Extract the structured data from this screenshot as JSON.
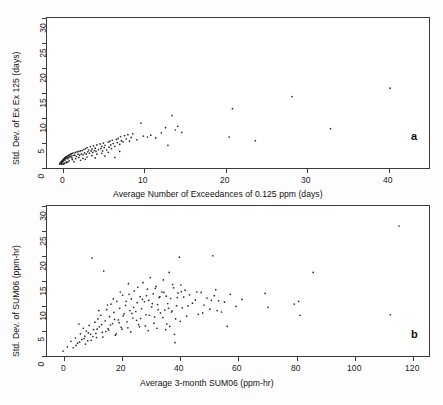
{
  "figure": {
    "background": "#fdfdfd",
    "axis_color": "#3b3b3b",
    "point_color": "#2b2b2b"
  },
  "panel_a": {
    "letter": "a",
    "xlabel": "Average Number of Exceedances of 0.125 ppm (days)",
    "ylabel": "Std. Dev. of Ex Ex 125 (days)",
    "x_ticks": [
      "0",
      "10",
      "20",
      "30",
      "40"
    ],
    "y_ticks": [
      "0",
      "5",
      "10",
      "15",
      "20",
      "25",
      "30"
    ]
  },
  "panel_b": {
    "letter": "b",
    "xlabel": "Average 3-month SUM06 (ppm-hr)",
    "ylabel": "Std. Dev. of SUM06 (ppm-hr)",
    "x_ticks": [
      "0",
      "20",
      "40",
      "60",
      "80",
      "100",
      "120"
    ],
    "y_ticks": [
      "0",
      "5",
      "10",
      "15",
      "20",
      "25",
      "30"
    ]
  },
  "chart_data": [
    {
      "type": "scatter",
      "panel": "a",
      "title": "",
      "xlabel": "Average Number of Exceedances of 0.125 ppm (days)",
      "ylabel": "Std. Dev. of Ex Ex 125 (days)",
      "xlim": [
        -1.5,
        45.5
      ],
      "ylim": [
        -1.2,
        31.5
      ],
      "xticks": [
        0,
        10,
        20,
        30,
        40
      ],
      "yticks": [
        0,
        5,
        10,
        15,
        20,
        25,
        30
      ],
      "grid": false,
      "legend": null,
      "marker": "dot",
      "points": [
        [
          0.05,
          0.1
        ],
        [
          0.08,
          0.2
        ],
        [
          0.1,
          0.15
        ],
        [
          0.12,
          0.3
        ],
        [
          0.15,
          0.25
        ],
        [
          0.18,
          0.4
        ],
        [
          0.2,
          0.2
        ],
        [
          0.22,
          0.5
        ],
        [
          0.25,
          0.35
        ],
        [
          0.28,
          0.6
        ],
        [
          0.3,
          0.45
        ],
        [
          0.32,
          0.7
        ],
        [
          0.35,
          0.5
        ],
        [
          0.38,
          0.8
        ],
        [
          0.4,
          0.6
        ],
        [
          0.42,
          0.9
        ],
        [
          0.45,
          0.7
        ],
        [
          0.48,
          1.0
        ],
        [
          0.5,
          0.8
        ],
        [
          0.52,
          1.1
        ],
        [
          0.55,
          0.9
        ],
        [
          0.58,
          1.2
        ],
        [
          0.6,
          1.0
        ],
        [
          0.62,
          1.3
        ],
        [
          0.65,
          1.1
        ],
        [
          0.68,
          1.4
        ],
        [
          0.7,
          1.2
        ],
        [
          0.72,
          0.95
        ],
        [
          0.75,
          1.5
        ],
        [
          0.78,
          1.25
        ],
        [
          0.8,
          1.6
        ],
        [
          0.85,
          1.35
        ],
        [
          0.9,
          1.7
        ],
        [
          0.95,
          1.45
        ],
        [
          1.0,
          1.8
        ],
        [
          1.05,
          1.2
        ],
        [
          1.1,
          1.9
        ],
        [
          1.15,
          1.5
        ],
        [
          1.2,
          2.0
        ],
        [
          1.25,
          1.6
        ],
        [
          1.3,
          2.1
        ],
        [
          1.35,
          1.7
        ],
        [
          1.4,
          2.2
        ],
        [
          1.45,
          1.8
        ],
        [
          1.5,
          2.3
        ],
        [
          1.55,
          1.4
        ],
        [
          1.6,
          2.4
        ],
        [
          1.7,
          1.9
        ],
        [
          1.8,
          2.5
        ],
        [
          1.9,
          2.0
        ],
        [
          2.0,
          2.6
        ],
        [
          2.1,
          1.7
        ],
        [
          2.2,
          2.7
        ],
        [
          2.3,
          2.2
        ],
        [
          2.4,
          2.8
        ],
        [
          2.5,
          2.0
        ],
        [
          2.6,
          2.9
        ],
        [
          2.7,
          2.3
        ],
        [
          2.8,
          3.0
        ],
        [
          2.9,
          2.1
        ],
        [
          3.0,
          3.2
        ],
        [
          3.1,
          2.5
        ],
        [
          3.2,
          3.4
        ],
        [
          3.3,
          2.2
        ],
        [
          3.4,
          3.6
        ],
        [
          3.5,
          2.7
        ],
        [
          3.6,
          3.1
        ],
        [
          3.7,
          2.4
        ],
        [
          3.8,
          3.8
        ],
        [
          3.9,
          2.9
        ],
        [
          4.0,
          3.3
        ],
        [
          4.1,
          2.6
        ],
        [
          4.2,
          4.0
        ],
        [
          4.3,
          3.0
        ],
        [
          4.4,
          3.5
        ],
        [
          4.5,
          2.8
        ],
        [
          4.6,
          4.2
        ],
        [
          4.8,
          3.2
        ],
        [
          5.0,
          4.4
        ],
        [
          5.1,
          3.4
        ],
        [
          5.2,
          3.9
        ],
        [
          5.3,
          2.9
        ],
        [
          5.4,
          4.6
        ],
        [
          5.5,
          3.6
        ],
        [
          5.6,
          4.1
        ],
        [
          5.8,
          3.1
        ],
        [
          6.0,
          4.8
        ],
        [
          6.1,
          3.7
        ],
        [
          6.2,
          5.0
        ],
        [
          6.3,
          4.2
        ],
        [
          6.4,
          3.4
        ],
        [
          6.5,
          5.2
        ],
        [
          6.6,
          4.5
        ],
        [
          6.8,
          3.9
        ],
        [
          7.0,
          5.4
        ],
        [
          7.1,
          4.7
        ],
        [
          7.2,
          5.6
        ],
        [
          7.4,
          4.3
        ],
        [
          7.5,
          6.0
        ],
        [
          7.6,
          5.1
        ],
        [
          7.8,
          4.9
        ],
        [
          8.0,
          6.2
        ],
        [
          8.2,
          5.5
        ],
        [
          8.4,
          6.4
        ],
        [
          8.6,
          5.0
        ],
        [
          8.8,
          5.8
        ],
        [
          9.0,
          6.6
        ],
        [
          9.5,
          5.3
        ],
        [
          10.0,
          8.9
        ],
        [
          10.3,
          6.1
        ],
        [
          10.8,
          5.9
        ],
        [
          11.2,
          6.3
        ],
        [
          11.8,
          5.7
        ],
        [
          12.5,
          6.8
        ],
        [
          13.0,
          7.9
        ],
        [
          13.3,
          4.1
        ],
        [
          13.8,
          10.5
        ],
        [
          14.2,
          7.4
        ],
        [
          14.5,
          8.2
        ],
        [
          15.0,
          6.9
        ],
        [
          20.8,
          5.9
        ],
        [
          21.2,
          12.0
        ],
        [
          24.0,
          5.1
        ],
        [
          28.5,
          14.6
        ],
        [
          33.2,
          7.7
        ],
        [
          40.5,
          16.4
        ],
        [
          0.3,
          0.05
        ],
        [
          0.6,
          0.3
        ],
        [
          0.9,
          0.55
        ],
        [
          1.2,
          0.75
        ],
        [
          1.6,
          1.05
        ],
        [
          2.0,
          1.25
        ],
        [
          2.4,
          1.5
        ],
        [
          2.9,
          1.3
        ],
        [
          3.4,
          1.6
        ],
        [
          4.0,
          1.9
        ],
        [
          4.6,
          2.2
        ],
        [
          5.2,
          2.4
        ],
        [
          6.0,
          2.6
        ],
        [
          6.8,
          1.5
        ],
        [
          7.4,
          2.8
        ],
        [
          1.8,
          0.6
        ],
        [
          2.6,
          0.9
        ],
        [
          3.2,
          1.1
        ],
        [
          4.4,
          1.4
        ],
        [
          5.6,
          1.8
        ],
        [
          0.45,
          0.05
        ],
        [
          0.55,
          0.12
        ],
        [
          0.65,
          0.22
        ],
        [
          0.85,
          0.38
        ],
        [
          1.05,
          0.5
        ]
      ]
    },
    {
      "type": "scatter",
      "panel": "b",
      "title": "",
      "xlabel": "Average 3-month SUM06 (ppm-hr)",
      "ylabel": "Std. Dev. of SUM06 (ppm-hr)",
      "xlim": [
        -5,
        127
      ],
      "ylim": [
        -1.2,
        31.5
      ],
      "xticks": [
        0,
        20,
        40,
        60,
        80,
        100,
        120
      ],
      "yticks": [
        0,
        5,
        10,
        15,
        20,
        25,
        30
      ],
      "grid": false,
      "legend": null,
      "marker": "dot",
      "points": [
        [
          0.5,
          0.3
        ],
        [
          2.0,
          1.2
        ],
        [
          3.2,
          2.4
        ],
        [
          4.0,
          1.0
        ],
        [
          4.8,
          3.1
        ],
        [
          5.5,
          2.0
        ],
        [
          6.0,
          6.1
        ],
        [
          6.5,
          4.0
        ],
        [
          7.0,
          2.8
        ],
        [
          7.5,
          5.2
        ],
        [
          8.0,
          3.5
        ],
        [
          8.5,
          4.6
        ],
        [
          9.0,
          2.5
        ],
        [
          9.5,
          5.8
        ],
        [
          10.0,
          3.9
        ],
        [
          10.5,
          20.3
        ],
        [
          11.0,
          4.9
        ],
        [
          11.5,
          6.5
        ],
        [
          12.0,
          3.2
        ],
        [
          12.5,
          7.2
        ],
        [
          13.0,
          5.5
        ],
        [
          13.5,
          8.0
        ],
        [
          14.0,
          4.3
        ],
        [
          14.5,
          17.5
        ],
        [
          15.0,
          6.8
        ],
        [
          15.5,
          9.2
        ],
        [
          16.0,
          5.1
        ],
        [
          16.5,
          7.7
        ],
        [
          17.0,
          10.4
        ],
        [
          17.5,
          6.2
        ],
        [
          18.0,
          8.6
        ],
        [
          18.5,
          3.7
        ],
        [
          19.0,
          11.0
        ],
        [
          19.5,
          7.0
        ],
        [
          20.0,
          9.5
        ],
        [
          20.5,
          5.4
        ],
        [
          21.0,
          12.3
        ],
        [
          21.5,
          8.3
        ],
        [
          22.0,
          10.1
        ],
        [
          22.5,
          6.6
        ],
        [
          23.0,
          14.8
        ],
        [
          23.5,
          9.0
        ],
        [
          24.0,
          11.5
        ],
        [
          24.5,
          7.4
        ],
        [
          25.0,
          13.2
        ],
        [
          25.5,
          8.8
        ],
        [
          26.0,
          10.7
        ],
        [
          26.5,
          6.0
        ],
        [
          27.0,
          12.0
        ],
        [
          27.5,
          9.4
        ],
        [
          28.0,
          15.0
        ],
        [
          28.5,
          10.9
        ],
        [
          29.0,
          8.1
        ],
        [
          29.5,
          13.6
        ],
        [
          30.0,
          11.2
        ],
        [
          30.5,
          16.1
        ],
        [
          31.0,
          9.8
        ],
        [
          31.5,
          12.6
        ],
        [
          32.0,
          7.6
        ],
        [
          32.5,
          14.2
        ],
        [
          33.0,
          10.3
        ],
        [
          33.5,
          11.8
        ],
        [
          34.0,
          8.5
        ],
        [
          34.5,
          13.0
        ],
        [
          35.0,
          15.6
        ],
        [
          35.5,
          9.1
        ],
        [
          36.0,
          12.1
        ],
        [
          36.5,
          10.5
        ],
        [
          37.0,
          17.2
        ],
        [
          37.5,
          11.6
        ],
        [
          38.0,
          8.9
        ],
        [
          38.5,
          13.9
        ],
        [
          39.0,
          2.1
        ],
        [
          39.5,
          10.0
        ],
        [
          40.0,
          12.8
        ],
        [
          40.5,
          20.5
        ],
        [
          41.0,
          14.5
        ],
        [
          41.5,
          9.6
        ],
        [
          42.0,
          11.9
        ],
        [
          42.5,
          13.4
        ],
        [
          43.0,
          7.8
        ],
        [
          44.0,
          12.4
        ],
        [
          45.0,
          10.6
        ],
        [
          46.0,
          11.3
        ],
        [
          47.0,
          8.2
        ],
        [
          48.0,
          12.9
        ],
        [
          49.0,
          10.2
        ],
        [
          50.0,
          11.7
        ],
        [
          51.0,
          9.3
        ],
        [
          52.0,
          20.8
        ],
        [
          52.5,
          12.2
        ],
        [
          53.0,
          13.5
        ],
        [
          54.0,
          11.1
        ],
        [
          55.0,
          8.7
        ],
        [
          56.0,
          10.8
        ],
        [
          57.0,
          5.6
        ],
        [
          58.0,
          12.5
        ],
        [
          60.0,
          9.9
        ],
        [
          62.0,
          11.4
        ],
        [
          70.0,
          12.7
        ],
        [
          71.0,
          9.7
        ],
        [
          80.0,
          10.4
        ],
        [
          81.5,
          11.0
        ],
        [
          82.0,
          8.0
        ],
        [
          86.5,
          17.2
        ],
        [
          113.0,
          8.1
        ],
        [
          116.0,
          27.2
        ],
        [
          5.0,
          1.5
        ],
        [
          6.2,
          2.2
        ],
        [
          7.8,
          3.0
        ],
        [
          9.2,
          4.2
        ],
        [
          10.8,
          3.4
        ],
        [
          12.2,
          5.0
        ],
        [
          13.8,
          6.0
        ],
        [
          15.2,
          4.5
        ],
        [
          16.8,
          5.9
        ],
        [
          18.2,
          7.1
        ],
        [
          19.8,
          6.4
        ],
        [
          21.2,
          7.9
        ],
        [
          22.8,
          5.3
        ],
        [
          24.2,
          8.4
        ],
        [
          25.8,
          6.9
        ],
        [
          27.2,
          7.3
        ],
        [
          28.8,
          5.7
        ],
        [
          30.2,
          8.0
        ],
        [
          31.8,
          6.3
        ],
        [
          33.2,
          9.2
        ],
        [
          34.8,
          7.5
        ],
        [
          36.2,
          6.1
        ],
        [
          37.8,
          8.7
        ],
        [
          39.2,
          7.2
        ],
        [
          40.8,
          6.7
        ],
        [
          20.2,
          13.0
        ],
        [
          23.2,
          12.5
        ],
        [
          26.2,
          14.0
        ],
        [
          29.2,
          12.2
        ],
        [
          32.2,
          13.8
        ],
        [
          35.2,
          12.9
        ],
        [
          38.2,
          14.6
        ],
        [
          41.2,
          13.1
        ],
        [
          12.8,
          9.0
        ],
        [
          15.8,
          10.2
        ],
        [
          17.8,
          11.5
        ],
        [
          22.2,
          11.0
        ],
        [
          24.8,
          9.7
        ],
        [
          27.8,
          11.4
        ],
        [
          31.2,
          10.5
        ],
        [
          33.8,
          12.0
        ],
        [
          36.8,
          9.5
        ],
        [
          39.8,
          11.8
        ],
        [
          43.5,
          10.0
        ],
        [
          46.5,
          13.0
        ],
        [
          48.5,
          8.5
        ],
        [
          51.5,
          11.2
        ],
        [
          53.5,
          9.0
        ],
        [
          8.2,
          1.8
        ],
        [
          10.2,
          2.6
        ],
        [
          11.8,
          4.1
        ],
        [
          14.2,
          3.3
        ],
        [
          16.2,
          4.8
        ],
        [
          18.8,
          4.0
        ],
        [
          20.8,
          5.0
        ],
        [
          23.8,
          4.4
        ],
        [
          26.8,
          5.5
        ],
        [
          29.8,
          4.7
        ],
        [
          32.8,
          5.2
        ],
        [
          35.8,
          4.9
        ],
        [
          37.2,
          5.6
        ],
        [
          38.8,
          3.9
        ]
      ]
    }
  ]
}
